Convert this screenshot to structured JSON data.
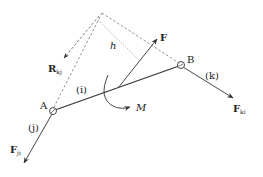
{
  "diagram": {
    "type": "free-body diagram of a two-force link",
    "points": {
      "A": {
        "label": "A"
      },
      "B": {
        "label": "B"
      }
    },
    "members": {
      "i": {
        "label": "(i)"
      },
      "j": {
        "label": "(j)"
      },
      "k": {
        "label": "(k)"
      }
    },
    "forces": {
      "F": {
        "label": "F"
      },
      "Fji": {
        "label": "F",
        "sub": "ji"
      },
      "Fki": {
        "label": "F",
        "sub": "ki"
      },
      "Rkj": {
        "label": "R",
        "sub": "kj"
      }
    },
    "moment": {
      "label": "M"
    },
    "distance": {
      "label": "h"
    },
    "colors": {
      "line": "#333333",
      "dashed": "#666666",
      "background": "#ffffff"
    }
  }
}
